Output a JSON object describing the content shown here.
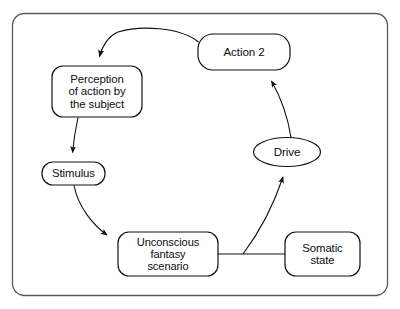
{
  "diagram": {
    "frame": {
      "name": "outer-frame",
      "stroke": "#4a4a4a"
    },
    "style": {
      "node_stroke": "#111111",
      "node_fill": "#ffffff",
      "edge_stroke": "#1a1a1a",
      "background": "#ffffff"
    },
    "nodes": [
      {
        "id": "perception",
        "shape": "rounded-rect",
        "label": "Perception\nof action by\nthe subject",
        "lines": [
          "Perception",
          "of action by",
          "the subject"
        ]
      },
      {
        "id": "action2",
        "shape": "rounded-rect",
        "label": "Action 2",
        "lines": [
          "Action 2"
        ]
      },
      {
        "id": "stimulus",
        "shape": "rounded-rect",
        "label": "Stimulus",
        "lines": [
          "Stimulus"
        ]
      },
      {
        "id": "drive",
        "shape": "ellipse",
        "label": "Drive",
        "lines": [
          "Drive"
        ]
      },
      {
        "id": "unconscious",
        "shape": "rounded-rect",
        "label": "Unconscious\nfantasy\nscenario",
        "lines": [
          "Unconscious",
          "fantasy",
          "scenario"
        ]
      },
      {
        "id": "somatic",
        "shape": "rounded-rect",
        "label": "Somatic\nstate",
        "lines": [
          "Somatic",
          "state"
        ]
      }
    ],
    "edges": [
      {
        "id": "action2-to-perception",
        "from": "action2",
        "to": "perception",
        "arrow": true,
        "style": "curved"
      },
      {
        "id": "perception-to-stimulus",
        "from": "perception",
        "to": "stimulus",
        "arrow": true,
        "style": "curved"
      },
      {
        "id": "stimulus-to-unconscious",
        "from": "stimulus",
        "to": "unconscious",
        "arrow": true,
        "style": "curved"
      },
      {
        "id": "unconscious-to-somatic",
        "from": "unconscious",
        "to": "somatic",
        "arrow": false,
        "style": "straight"
      },
      {
        "id": "unconscious-somatic-to-drive",
        "from": "unconscious-somatic-link",
        "to": "drive",
        "arrow": true,
        "style": "curved"
      },
      {
        "id": "drive-to-action2",
        "from": "drive",
        "to": "action2",
        "arrow": true,
        "style": "curved"
      }
    ]
  }
}
